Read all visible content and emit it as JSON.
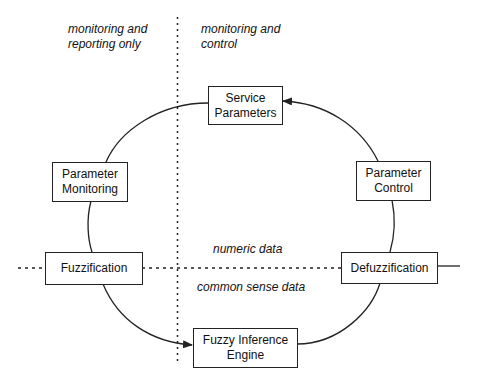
{
  "diagram": {
    "regions": {
      "left_top": "monitoring and reporting only",
      "right_top": "monitoring and control",
      "upper_middle": "numeric data",
      "lower_middle": "common sense data"
    },
    "nodes": [
      {
        "id": "service-parameters",
        "label": "Service Parameters"
      },
      {
        "id": "parameter-monitoring",
        "label": "Parameter Monitoring"
      },
      {
        "id": "parameter-control",
        "label": "Parameter Control"
      },
      {
        "id": "fuzzification",
        "label": "Fuzzification"
      },
      {
        "id": "defuzzification",
        "label": "Defuzzification"
      },
      {
        "id": "fuzzy-inference-engine",
        "label": "Fuzzy Inference Engine"
      }
    ],
    "edges": [
      {
        "from": "service-parameters",
        "to": "parameter-monitoring"
      },
      {
        "from": "parameter-monitoring",
        "to": "fuzzification"
      },
      {
        "from": "fuzzification",
        "to": "fuzzy-inference-engine",
        "arrow": true
      },
      {
        "from": "fuzzy-inference-engine",
        "to": "defuzzification"
      },
      {
        "from": "defuzzification",
        "to": "parameter-control"
      },
      {
        "from": "parameter-control",
        "to": "service-parameters",
        "arrow": true
      }
    ],
    "colors": {
      "line": "#222222",
      "background": "#ffffff"
    }
  }
}
